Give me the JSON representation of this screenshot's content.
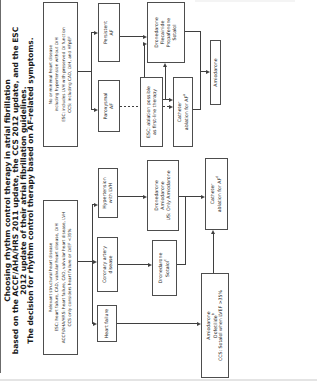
{
  "figure": {
    "title_lines": [
      "Choosing rhythm control therapy in atrial fibrillation",
      "based on the ACCF/AHA/HRS 2011 update, the CCS 2012 update, and the ESC",
      "2012 update of their atrial fibrillation guidelines.",
      "The decision for rhythm control therapy based on AF-related symptoms."
    ]
  },
  "boxes": {
    "relevant": [
      "Relevant structural heart disease",
      "ESC: heart failure, CAD, valvular heart disease, LVH",
      "ACCF/AHA/HRS: heart failure, CAD, valvular heart disease, LVH",
      "CCS only considers heart failure or LVEF <35%"
    ],
    "minimal": [
      "No or minimal heart disease",
      "including hypertension without LVH",
      "ESC: includes LVH with preserved LV function",
      "CCS: including CAD, LVH, and HFpEF"
    ],
    "heart_failure": [
      "Heart failure"
    ],
    "cad": [
      "Coronary artery",
      "disease"
    ],
    "htn": [
      "Hypertension",
      "with LVH"
    ],
    "paroxysmal": [
      "Paroxysmal",
      "AF"
    ],
    "persistent": [
      "Persistent",
      "AF"
    ],
    "amio_dof": {
      "l1": "Amiodarone",
      "l2": "Dofetilide",
      "l2sup": "b",
      "l3": "CCS: Sotalol when LVEF >35%"
    },
    "dron_sot": {
      "l1": "Dronedarone",
      "l2": "Sotalol",
      "l2sup": "c"
    },
    "dron_amio": [
      "Dronedarone",
      "Amiodarone",
      "US: Only Amiodarone"
    ],
    "catheter_d": {
      "l1": "Catheter",
      "l2": "ablation for AF",
      "l2sup": "d"
    },
    "esc_note": [
      "ESC: ablation possible",
      "as first-line therapy"
    ],
    "catheter_a": {
      "l1": "Catheter",
      "l2": "ablation for AF",
      "l2sup": "a"
    },
    "drugs4": [
      "Dronedarone",
      "Flecainide",
      "Propafenone",
      "Sotalol"
    ],
    "amiodarone": [
      "Amiodarone"
    ]
  },
  "colors": {
    "box_border": "#4d4d4d",
    "line": "#3f3f3f",
    "text": "#222222",
    "background": "#ffffff"
  }
}
